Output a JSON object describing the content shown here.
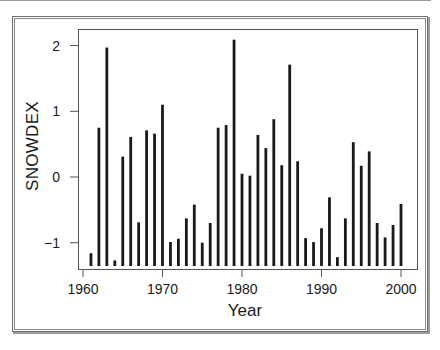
{
  "chart_data": {
    "type": "bar",
    "title": "",
    "xlabel": "Year",
    "ylabel": "SNOWDEX",
    "x_ticks": [
      1960,
      1970,
      1980,
      1990,
      2000
    ],
    "x_tick_labels": [
      "1960",
      "1970",
      "1980",
      "1990",
      "2000"
    ],
    "y_ticks": [
      -1,
      0,
      1,
      2
    ],
    "y_tick_labels": [
      "−1",
      "0",
      "1",
      "2"
    ],
    "xlim": [
      1958.3,
      2002
    ],
    "ylim": [
      -1.38,
      2.25
    ],
    "baseline": -1.38,
    "grid": false,
    "legend": null,
    "bar_style": "vertical lines from baseline (histogram-style spikes)",
    "categories": [
      1961,
      1962,
      1963,
      1964,
      1965,
      1966,
      1967,
      1968,
      1969,
      1970,
      1971,
      1972,
      1973,
      1974,
      1975,
      1976,
      1977,
      1978,
      1979,
      1980,
      1981,
      1982,
      1983,
      1984,
      1985,
      1986,
      1987,
      1988,
      1989,
      1990,
      1991,
      1992,
      1993,
      1994,
      1995,
      1996,
      1997,
      1998,
      1999,
      2000
    ],
    "values": [
      -1.16,
      0.75,
      1.97,
      -1.27,
      0.31,
      0.61,
      -0.69,
      0.71,
      0.66,
      1.1,
      -0.99,
      -0.94,
      -0.63,
      -0.42,
      -1.0,
      -0.7,
      0.75,
      0.79,
      2.09,
      0.05,
      0.02,
      0.64,
      0.44,
      0.88,
      0.18,
      1.71,
      0.24,
      -0.93,
      -0.99,
      -0.78,
      -0.31,
      -1.22,
      -0.63,
      0.53,
      0.17,
      0.39,
      -0.7,
      -0.92,
      -0.73,
      -0.41
    ],
    "colors": {
      "bar": "#1a1a1a",
      "axis": "#555555"
    }
  }
}
